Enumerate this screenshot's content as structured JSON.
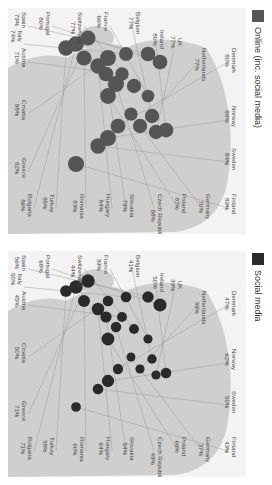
{
  "chart_data": [
    {
      "type": "bubble-map",
      "title": "Social media",
      "legend": [
        {
          "label": "Social media",
          "color": "#2a2a2a"
        }
      ],
      "marker_color": "#2a2a2a",
      "countries": [
        {
          "name": "Finland",
          "value": "43%",
          "lx": 186,
          "ly": 8,
          "cx": 150,
          "cy": 60
        },
        {
          "name": "Sweden",
          "value": "50%",
          "lx": 140,
          "ly": 8,
          "cx": 128,
          "cy": 78
        },
        {
          "name": "Norway",
          "value": "62%",
          "lx": 98,
          "ly": 8,
          "cx": 118,
          "cy": 86
        },
        {
          "name": "Denmark",
          "value": "47%",
          "lx": 40,
          "ly": 8,
          "cx": 108,
          "cy": 98
        },
        {
          "name": "Germany",
          "value": "37%",
          "lx": 186,
          "ly": 34,
          "cx": 95,
          "cy": 110
        },
        {
          "name": "Netherlands",
          "value": "39%",
          "lx": 40,
          "ly": 38,
          "cx": 86,
          "cy": 98
        },
        {
          "name": "UK",
          "value": "39%",
          "lx": 28,
          "ly": 62,
          "cx": 70,
          "cy": 92
        },
        {
          "name": "Ireland",
          "value": "50%",
          "lx": 22,
          "ly": 80,
          "cx": 60,
          "cy": 94
        },
        {
          "name": "Poland",
          "value": "66%",
          "lx": 186,
          "ly": 58,
          "cx": 118,
          "cy": 128
        },
        {
          "name": "Belgium",
          "value": "41%",
          "lx": 4,
          "ly": 104,
          "cx": 74,
          "cy": 108
        },
        {
          "name": "Czech Republic",
          "value": "49%",
          "lx": 186,
          "ly": 82,
          "cx": 110,
          "cy": 140
        },
        {
          "name": "France",
          "value": "39%",
          "lx": 4,
          "ly": 136,
          "cx": 78,
          "cy": 128
        },
        {
          "name": "Slovakia",
          "value": "54%",
          "lx": 186,
          "ly": 110,
          "cx": 120,
          "cy": 150
        },
        {
          "name": "Hungary",
          "value": "64%",
          "lx": 186,
          "ly": 134,
          "cx": 128,
          "cy": 158
        },
        {
          "name": "Switzerland",
          "value": "44%",
          "lx": 4,
          "ly": 162,
          "cx": 92,
          "cy": 138
        },
        {
          "name": "Portugal",
          "value": "68%",
          "lx": 4,
          "ly": 194,
          "cx": 66,
          "cy": 162
        },
        {
          "name": "Romania",
          "value": "60%",
          "lx": 186,
          "ly": 160,
          "cx": 142,
          "cy": 166
        },
        {
          "name": "Austria",
          "value": "45%",
          "lx": 40,
          "ly": 218,
          "cx": 104,
          "cy": 150
        },
        {
          "name": "Spain",
          "value": "56%",
          "lx": 4,
          "ly": 218,
          "cx": 78,
          "cy": 170
        },
        {
          "name": "Italy",
          "value": "50%",
          "lx": 22,
          "ly": 222,
          "cx": 100,
          "cy": 170
        },
        {
          "name": "Croatia",
          "value": "50%",
          "lx": 92,
          "ly": 218,
          "cx": 118,
          "cy": 166
        },
        {
          "name": "Turkey",
          "value": "58%",
          "lx": 186,
          "ly": 190,
          "cx": 160,
          "cy": 176
        },
        {
          "name": "Bulgaria",
          "value": "71%",
          "lx": 186,
          "ly": 212,
          "cx": 150,
          "cy": 180
        },
        {
          "name": "Greece",
          "value": "71%",
          "lx": 150,
          "ly": 218,
          "cx": 138,
          "cy": 186
        }
      ]
    },
    {
      "type": "bubble-map",
      "title": "Online (inc. social media)",
      "legend": [
        {
          "label": "Online (inc. social media)",
          "color": "#555555"
        }
      ],
      "marker_color": "#555555",
      "countries": [
        {
          "name": "Finland",
          "value": "89%",
          "lx": 186,
          "ly": 8,
          "cx": 150,
          "cy": 60
        },
        {
          "name": "Sweden",
          "value": "84%",
          "lx": 140,
          "ly": 8,
          "cx": 128,
          "cy": 78
        },
        {
          "name": "Norway",
          "value": "88%",
          "lx": 98,
          "ly": 8,
          "cx": 118,
          "cy": 86
        },
        {
          "name": "Denmark",
          "value": "80%",
          "lx": 40,
          "ly": 8,
          "cx": 108,
          "cy": 98
        },
        {
          "name": "Germany",
          "value": "70%",
          "lx": 186,
          "ly": 34,
          "cx": 95,
          "cy": 110
        },
        {
          "name": "Netherlands",
          "value": "77%",
          "lx": 40,
          "ly": 38,
          "cx": 86,
          "cy": 98
        },
        {
          "name": "UK",
          "value": "77%",
          "lx": 28,
          "ly": 62,
          "cx": 70,
          "cy": 92
        },
        {
          "name": "Ireland",
          "value": "80%",
          "lx": 22,
          "ly": 80,
          "cx": 60,
          "cy": 94
        },
        {
          "name": "Poland",
          "value": "87%",
          "lx": 186,
          "ly": 58,
          "cx": 118,
          "cy": 128
        },
        {
          "name": "Belgium",
          "value": "77%",
          "lx": 4,
          "ly": 104,
          "cx": 74,
          "cy": 108
        },
        {
          "name": "Czech Republic",
          "value": "88%",
          "lx": 186,
          "ly": 82,
          "cx": 110,
          "cy": 140
        },
        {
          "name": "France",
          "value": "66%",
          "lx": 4,
          "ly": 136,
          "cx": 78,
          "cy": 128
        },
        {
          "name": "Slovakia",
          "value": "79%",
          "lx": 186,
          "ly": 110,
          "cx": 120,
          "cy": 150
        },
        {
          "name": "Hungary",
          "value": "84%",
          "lx": 186,
          "ly": 134,
          "cx": 128,
          "cy": 158
        },
        {
          "name": "Switzerland",
          "value": "77%",
          "lx": 4,
          "ly": 162,
          "cx": 92,
          "cy": 138
        },
        {
          "name": "Portugal",
          "value": "80%",
          "lx": 4,
          "ly": 194,
          "cx": 66,
          "cy": 162
        },
        {
          "name": "Romania",
          "value": "83%",
          "lx": 186,
          "ly": 160,
          "cx": 142,
          "cy": 166
        },
        {
          "name": "Austria",
          "value": "71%",
          "lx": 40,
          "ly": 218,
          "cx": 104,
          "cy": 150
        },
        {
          "name": "Spain",
          "value": "79%",
          "lx": 4,
          "ly": 218,
          "cx": 78,
          "cy": 170
        },
        {
          "name": "Italy",
          "value": "74%",
          "lx": 22,
          "ly": 222,
          "cx": 100,
          "cy": 170
        },
        {
          "name": "Croatia",
          "value": "88%",
          "lx": 92,
          "ly": 218,
          "cx": 118,
          "cy": 166
        },
        {
          "name": "Turkey",
          "value": "85%",
          "lx": 186,
          "ly": 190,
          "cx": 160,
          "cy": 176
        },
        {
          "name": "Bulgaria",
          "value": "86%",
          "lx": 186,
          "ly": 212,
          "cx": 150,
          "cy": 180
        },
        {
          "name": "Greece",
          "value": "82%",
          "lx": 150,
          "ly": 218,
          "cx": 138,
          "cy": 186
        }
      ]
    }
  ],
  "panels": {
    "left": {
      "legend_label": "Online (inc. social media)",
      "legend_color": "#555555"
    },
    "right": {
      "legend_label": "Social media",
      "legend_color": "#2a2a2a"
    }
  },
  "colors": {
    "land": "#cfcfcf",
    "sea": "#f3f3f3",
    "leader": "#9a9a9a"
  }
}
